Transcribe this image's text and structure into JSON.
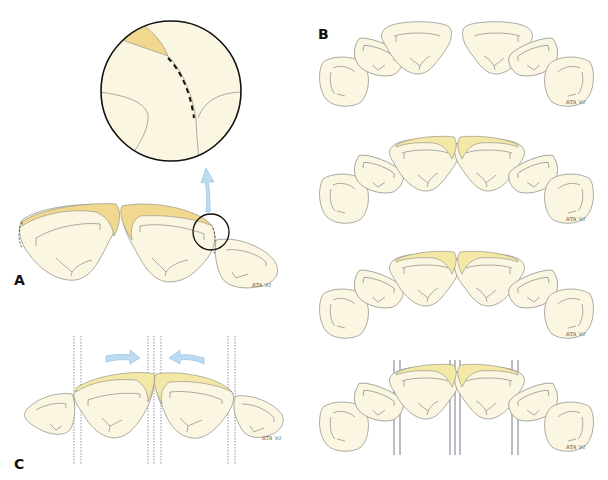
{
  "figure": {
    "panels": [
      {
        "id": "A",
        "label": "A",
        "description": "Two incisors with veneer overlay and magnified inset of proximal contact area",
        "signature": "RTA '91"
      },
      {
        "id": "B",
        "label": "B",
        "description": "Anterior arch sequence showing progressive veneer preparation (4 stages)",
        "signature": "RTA '91"
      },
      {
        "id": "C",
        "label": "C",
        "description": "Incisors with veneers and guide lines, arrows indicating closure",
        "signature": "RTA '91"
      }
    ],
    "colors": {
      "tooth_fill": "#fbf6e2",
      "veneer_fill": "#f0d88e",
      "veneer_light_fill": "#f4e8a6",
      "arrow_fill": "#bcdcf2",
      "outline": "#8a8a80"
    }
  }
}
